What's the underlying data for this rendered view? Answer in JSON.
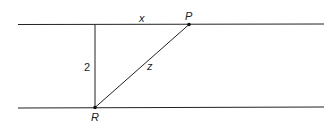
{
  "diagram": {
    "labels": {
      "x": "x",
      "P": "P",
      "two": "2",
      "z": "z",
      "R": "R"
    },
    "colors": {
      "line": "#222222",
      "background": "#ffffff"
    }
  }
}
